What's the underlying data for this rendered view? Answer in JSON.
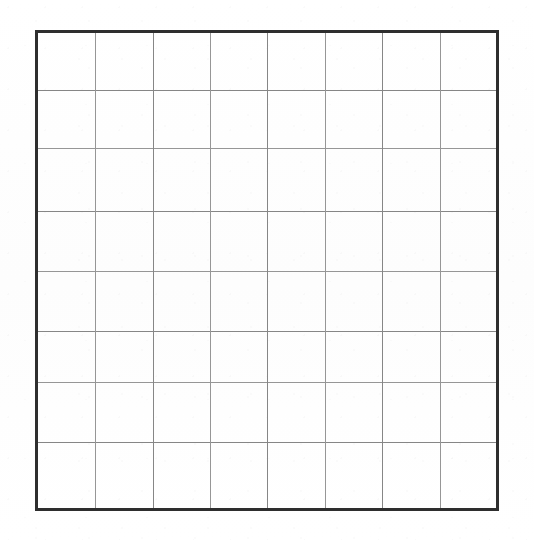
{
  "page": {
    "background_color": "#ffffff",
    "width": 534,
    "height": 540
  },
  "grid": {
    "name": "blank-grid",
    "columns": 8,
    "rows": 8,
    "cell_count": 64,
    "cell_text": "",
    "geometry": {
      "left": 36,
      "top": 31,
      "width": 462,
      "height": 479,
      "column_width": 57.75,
      "row_height": 59.88
    },
    "style": {
      "outer_border_color": "#2e2e2e",
      "outer_border_width": 3,
      "inner_line_color": "#8c8c8c",
      "inner_line_width": 1,
      "cell_fill": "#ffffff"
    },
    "column_line_positions": [
      36,
      95,
      153,
      210,
      267,
      325,
      382,
      440,
      498
    ],
    "row_line_positions": [
      31,
      90,
      148,
      211,
      271,
      331,
      382,
      442,
      510
    ],
    "cells": [
      [
        "",
        "",
        "",
        "",
        "",
        "",
        "",
        ""
      ],
      [
        "",
        "",
        "",
        "",
        "",
        "",
        "",
        ""
      ],
      [
        "",
        "",
        "",
        "",
        "",
        "",
        "",
        ""
      ],
      [
        "",
        "",
        "",
        "",
        "",
        "",
        "",
        ""
      ],
      [
        "",
        "",
        "",
        "",
        "",
        "",
        "",
        ""
      ],
      [
        "",
        "",
        "",
        "",
        "",
        "",
        "",
        ""
      ],
      [
        "",
        "",
        "",
        "",
        "",
        "",
        "",
        ""
      ],
      [
        "",
        "",
        "",
        "",
        "",
        "",
        "",
        ""
      ]
    ]
  }
}
